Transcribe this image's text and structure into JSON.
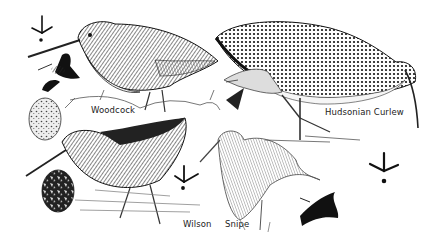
{
  "illustration": {
    "subject": "shorebirds plate",
    "labels": {
      "woodcock": "Woodcock",
      "curlew": "Hudsonian Curlew",
      "wilson": "Wilson",
      "snipe": "Snipe"
    },
    "icons": [
      "footprint-icon",
      "footprint-icon",
      "footprint-icon",
      "egg-icon",
      "egg-icon",
      "flying-bird-icon",
      "flying-bird-icon",
      "flying-bird-icon"
    ]
  }
}
